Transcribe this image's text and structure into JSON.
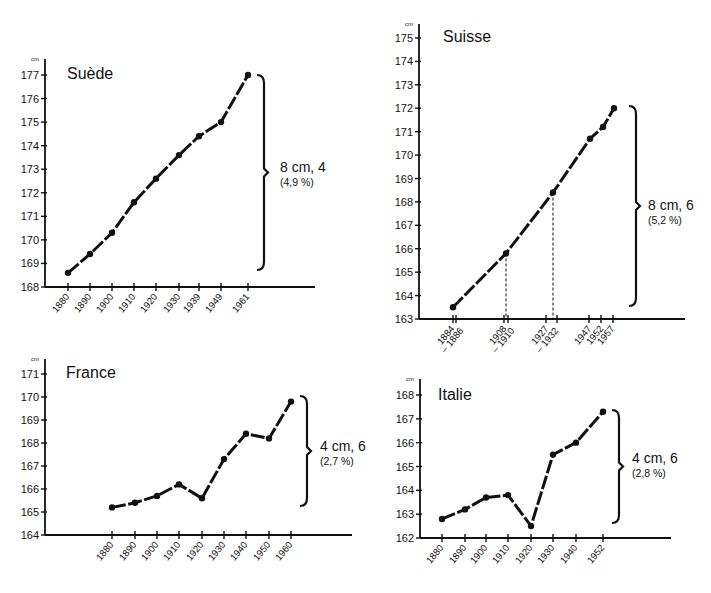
{
  "chart_data": [
    {
      "type": "line",
      "title": "Suède",
      "ylabel": "cm",
      "xlabel": "",
      "ylim": [
        168,
        177
      ],
      "yticks": [
        168,
        169,
        170,
        171,
        172,
        173,
        174,
        175,
        176,
        177
      ],
      "categories": [
        "1880",
        "1890",
        "1900",
        "1910",
        "1920",
        "1930",
        "1939",
        "1949",
        "1961"
      ],
      "x_px": [
        68,
        90,
        112,
        134,
        156,
        179,
        199,
        221,
        248
      ],
      "values": [
        168.6,
        169.4,
        170.3,
        171.6,
        172.6,
        173.6,
        174.4,
        175.0,
        177.0
      ],
      "annotation": {
        "main": "8 cm, 4",
        "sub": "(4,9 %)"
      },
      "grid": false,
      "legend": "none",
      "layout": {
        "axis_x": 45,
        "axis_end": 315,
        "y_top": 75,
        "y_bottom": 287,
        "top_tick": 177,
        "bottom_tick": 168,
        "cm_y": 61,
        "title_x": 67,
        "title_y": 79,
        "brace_x": 262,
        "brace_top": 75,
        "brace_bottom": 270,
        "annot_x": 280,
        "annot_y1": 172,
        "annot_y2": 186
      }
    },
    {
      "type": "line",
      "title": "Suisse",
      "ylabel": "cm",
      "xlabel": "",
      "ylim": [
        163,
        175
      ],
      "yticks": [
        163,
        164,
        165,
        166,
        167,
        168,
        169,
        170,
        171,
        172,
        173,
        174,
        175
      ],
      "categories": [
        "1884 – 1886",
        "1908 – 1910",
        "1927 – 1932",
        "1947",
        "1952",
        "1957"
      ],
      "tick_labels": [
        {
          "text": "1884",
          "x": 453
        },
        {
          "text": "– 1886",
          "x": 462
        },
        {
          "text": "1908",
          "x": 505
        },
        {
          "text": "– 1910",
          "x": 513
        },
        {
          "text": "1927",
          "x": 547
        },
        {
          "text": "– 1932",
          "x": 557
        },
        {
          "text": "1947",
          "x": 590
        },
        {
          "text": "1952",
          "x": 602
        },
        {
          "text": "1957",
          "x": 613
        }
      ],
      "tick_x": [
        453,
        456,
        504,
        508,
        546,
        557,
        589,
        601,
        613
      ],
      "x_px": [
        453,
        506,
        553,
        590,
        603,
        614
      ],
      "values": [
        163.5,
        165.8,
        168.4,
        170.7,
        171.2,
        172.0
      ],
      "guides": [
        {
          "x": 506,
          "value": 165.8
        },
        {
          "x": 553,
          "value": 168.4
        }
      ],
      "annotation": {
        "main": "8 cm, 6",
        "sub": "(5,2 %)"
      },
      "grid": false,
      "legend": "none",
      "layout": {
        "axis_x": 419,
        "axis_end": 685,
        "y_top": 38,
        "y_bottom": 319,
        "top_tick": 175,
        "bottom_tick": 163,
        "cm_y": 26,
        "title_x": 443,
        "title_y": 42,
        "brace_x": 634,
        "brace_top": 106,
        "brace_bottom": 306,
        "annot_x": 648,
        "annot_y1": 210,
        "annot_y2": 224
      }
    },
    {
      "type": "line",
      "title": "France",
      "ylabel": "cm",
      "xlabel": "",
      "ylim": [
        164,
        171
      ],
      "yticks": [
        164,
        165,
        166,
        167,
        168,
        169,
        170,
        171
      ],
      "categories": [
        "1880",
        "1890",
        "1900",
        "1910",
        "1920",
        "1930",
        "1940",
        "1950",
        "1960"
      ],
      "x_px": [
        112,
        135,
        157,
        179,
        202,
        224,
        246,
        269,
        291
      ],
      "values": [
        165.2,
        165.4,
        165.7,
        166.2,
        165.6,
        167.3,
        168.4,
        168.2,
        169.8
      ],
      "annotation": {
        "main": "4 cm, 6",
        "sub": "(2,7 %)"
      },
      "grid": false,
      "legend": "none",
      "layout": {
        "axis_x": 45,
        "axis_end": 352,
        "y_top": 374,
        "y_bottom": 535,
        "top_tick": 171,
        "bottom_tick": 164,
        "cm_y": 361,
        "title_x": 66,
        "title_y": 378,
        "brace_x": 305,
        "brace_top": 396,
        "brace_bottom": 506,
        "annot_x": 320,
        "annot_y1": 451,
        "annot_y2": 465
      }
    },
    {
      "type": "line",
      "title": "Italie",
      "ylabel": "cm",
      "xlabel": "",
      "ylim": [
        162,
        168
      ],
      "yticks": [
        162,
        163,
        164,
        165,
        166,
        167,
        168
      ],
      "categories": [
        "1880",
        "1890",
        "1900",
        "1910",
        "1920",
        "1930",
        "1940",
        "1952"
      ],
      "x_px": [
        442,
        465,
        486,
        508,
        531,
        553,
        576,
        603
      ],
      "values": [
        162.8,
        163.2,
        163.7,
        163.8,
        162.5,
        165.5,
        166.0,
        167.3
      ],
      "annotation": {
        "main": "4 cm, 6",
        "sub": "(2,8 %)"
      },
      "grid": false,
      "legend": "none",
      "layout": {
        "axis_x": 420,
        "axis_end": 671,
        "y_top": 395,
        "y_bottom": 538,
        "top_tick": 168,
        "bottom_tick": 162,
        "cm_y": 381,
        "title_x": 438,
        "title_y": 400,
        "brace_x": 617,
        "brace_top": 410,
        "brace_bottom": 523,
        "annot_x": 632,
        "annot_y1": 463,
        "annot_y2": 477
      }
    }
  ]
}
